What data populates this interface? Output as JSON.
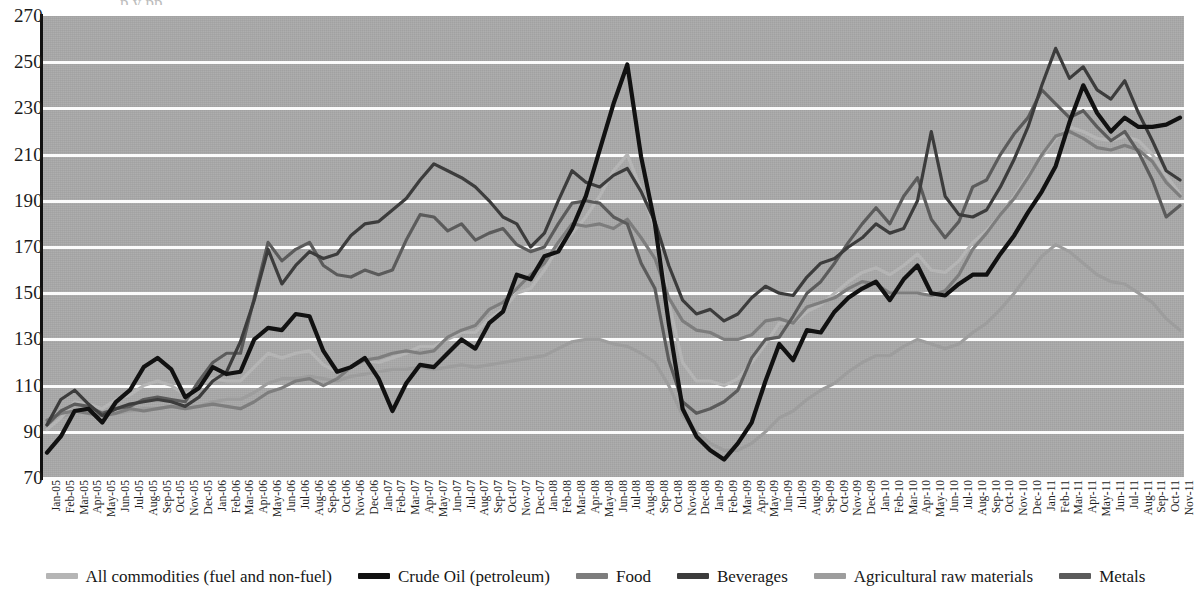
{
  "header": {
    "clipped_title": "p      y      pp"
  },
  "chart_data": {
    "type": "line",
    "title": "",
    "xlabel": "",
    "ylabel": "",
    "ylim": [
      70,
      270
    ],
    "ytick_step": 20,
    "grid": true,
    "legend_position": "bottom",
    "yticks": [
      270,
      250,
      230,
      210,
      190,
      170,
      150,
      130,
      110,
      90,
      70
    ],
    "categories": [
      "Jan-05",
      "Feb-05",
      "Mar-05",
      "Apr-05",
      "May-05",
      "Jun-05",
      "Jul-05",
      "Aug-05",
      "Sep-05",
      "Oct-05",
      "Nov-05",
      "Dec-05",
      "Jan-06",
      "Feb-06",
      "Mar-06",
      "Apr-06",
      "May-06",
      "Jun-06",
      "Jul-06",
      "Aug-06",
      "Sep-06",
      "Oct-06",
      "Nov-06",
      "Dec-06",
      "Jan-07",
      "Feb-07",
      "Mar-07",
      "Apr-07",
      "May-07",
      "Jun-07",
      "Jul-07",
      "Aug-07",
      "Sep-07",
      "Oct-07",
      "Nov-07",
      "Dec-07",
      "Jan-08",
      "Feb-08",
      "Mar-08",
      "Apr-08",
      "May-08",
      "Jun-08",
      "Jul-08",
      "Aug-08",
      "Sep-08",
      "Oct-08",
      "Nov-08",
      "Dec-08",
      "Jan-09",
      "Feb-09",
      "Mar-09",
      "Apr-09",
      "May-09",
      "Jun-09",
      "Jul-09",
      "Aug-09",
      "Sep-09",
      "Oct-09",
      "Nov-09",
      "Dec-09",
      "Jan-10",
      "Feb-10",
      "Mar-10",
      "Apr-10",
      "May-10",
      "Jun-10",
      "Jul-10",
      "Aug-10",
      "Sep-10",
      "Oct-10",
      "Nov-10",
      "Dec-10",
      "Jan-11",
      "Feb-11",
      "Mar-11",
      "Apr-11",
      "May-11",
      "Jun-11",
      "Jul-11",
      "Aug-11",
      "Sep-11",
      "Oct-11",
      "Nov-11"
    ],
    "series": [
      {
        "name": "All commodities (fuel and non-fuel)",
        "color": "#b5b5b5",
        "values": [
          91,
          96,
          103,
          102,
          100,
          104,
          106,
          110,
          112,
          110,
          106,
          110,
          113,
          112,
          112,
          118,
          124,
          122,
          124,
          125,
          119,
          116,
          118,
          121,
          120,
          122,
          124,
          127,
          127,
          130,
          133,
          133,
          139,
          143,
          150,
          152,
          160,
          170,
          176,
          183,
          192,
          203,
          210,
          195,
          178,
          146,
          120,
          112,
          112,
          110,
          113,
          120,
          128,
          137,
          137,
          142,
          145,
          150,
          155,
          159,
          161,
          158,
          162,
          167,
          160,
          159,
          164,
          172,
          177,
          184,
          192,
          201,
          209,
          217,
          222,
          220,
          217,
          216,
          218,
          216,
          210,
          201,
          193
        ]
      },
      {
        "name": "Crude Oil (petroleum)",
        "color": "#111111",
        "values": [
          81,
          88,
          99,
          100,
          94,
          103,
          108,
          118,
          122,
          117,
          105,
          109,
          118,
          115,
          116,
          130,
          135,
          134,
          141,
          140,
          125,
          116,
          118,
          122,
          113,
          99,
          111,
          119,
          118,
          124,
          130,
          126,
          137,
          142,
          158,
          156,
          166,
          168,
          178,
          192,
          212,
          232,
          249,
          209,
          180,
          137,
          100,
          88,
          82,
          78,
          85,
          94,
          112,
          128,
          121,
          134,
          133,
          142,
          148,
          152,
          155,
          147,
          156,
          162,
          150,
          149,
          154,
          158,
          158,
          167,
          175,
          185,
          194,
          205,
          224,
          240,
          228,
          220,
          226,
          222,
          222,
          223,
          226
        ]
      },
      {
        "name": "Food",
        "color": "#7d7d7d",
        "values": [
          95,
          98,
          99,
          98,
          97,
          98,
          100,
          99,
          100,
          101,
          100,
          101,
          102,
          101,
          100,
          103,
          107,
          109,
          112,
          113,
          110,
          113,
          118,
          121,
          122,
          124,
          125,
          124,
          125,
          131,
          134,
          136,
          143,
          146,
          152,
          158,
          163,
          172,
          180,
          179,
          180,
          178,
          182,
          174,
          165,
          148,
          138,
          134,
          133,
          130,
          130,
          132,
          138,
          139,
          137,
          144,
          146,
          148,
          152,
          155,
          154,
          150,
          150,
          150,
          149,
          151,
          158,
          169,
          176,
          184,
          191,
          200,
          210,
          218,
          220,
          217,
          213,
          212,
          214,
          212,
          207,
          198,
          192
        ]
      },
      {
        "name": "Beverages",
        "color": "#3c3c3c",
        "values": [
          93,
          104,
          108,
          102,
          97,
          100,
          102,
          103,
          104,
          103,
          101,
          105,
          112,
          116,
          129,
          147,
          169,
          154,
          162,
          168,
          165,
          167,
          175,
          180,
          181,
          186,
          191,
          199,
          206,
          203,
          200,
          196,
          190,
          183,
          180,
          170,
          176,
          190,
          203,
          198,
          196,
          201,
          204,
          194,
          181,
          162,
          147,
          141,
          143,
          138,
          141,
          148,
          153,
          150,
          149,
          157,
          163,
          165,
          170,
          174,
          180,
          176,
          178,
          190,
          220,
          192,
          184,
          183,
          186,
          196,
          208,
          222,
          240,
          256,
          243,
          248,
          238,
          234,
          242,
          228,
          216,
          203,
          199
        ]
      },
      {
        "name": "Agricultural raw materials",
        "color": "#9d9d9d",
        "values": [
          92,
          96,
          99,
          99,
          98,
          98,
          99,
          100,
          100,
          101,
          100,
          101,
          103,
          104,
          104,
          107,
          111,
          113,
          113,
          114,
          113,
          112,
          114,
          115,
          116,
          117,
          117,
          118,
          117,
          118,
          119,
          118,
          119,
          120,
          121,
          122,
          123,
          126,
          129,
          130,
          130,
          128,
          127,
          124,
          120,
          110,
          97,
          90,
          85,
          82,
          82,
          85,
          90,
          96,
          99,
          104,
          108,
          111,
          116,
          120,
          123,
          123,
          127,
          130,
          128,
          126,
          128,
          133,
          137,
          143,
          150,
          158,
          166,
          171,
          168,
          163,
          158,
          155,
          154,
          150,
          146,
          139,
          134
        ]
      },
      {
        "name": "Metals",
        "color": "#5b5b5b",
        "values": [
          93,
          99,
          102,
          101,
          98,
          100,
          101,
          104,
          105,
          104,
          103,
          112,
          120,
          124,
          124,
          148,
          172,
          164,
          169,
          172,
          162,
          158,
          157,
          160,
          158,
          160,
          173,
          184,
          183,
          177,
          180,
          173,
          176,
          178,
          171,
          168,
          170,
          180,
          189,
          190,
          189,
          183,
          180,
          163,
          152,
          121,
          103,
          98,
          100,
          103,
          108,
          122,
          130,
          131,
          140,
          150,
          155,
          163,
          172,
          180,
          187,
          180,
          192,
          200,
          182,
          174,
          181,
          196,
          199,
          210,
          219,
          226,
          238,
          232,
          226,
          229,
          222,
          216,
          220,
          211,
          199,
          183,
          188
        ]
      }
    ]
  }
}
